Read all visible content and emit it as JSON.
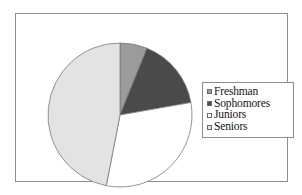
{
  "chart_data": {
    "type": "pie",
    "title": "",
    "categories": [
      "Freshman",
      "Sophomores",
      "Juniors",
      "Seniors"
    ],
    "values": [
      6,
      16,
      31,
      47
    ],
    "unit": "percent",
    "start_angle_deg": 0,
    "direction": "clockwise",
    "slice_boundaries_deg": [
      0,
      22,
      80,
      191,
      360
    ],
    "colors": [
      "#9b9b9b",
      "#4a4a4a",
      "#ffffff",
      "#e3e3e3"
    ],
    "legend": {
      "position": "right",
      "entries": [
        {
          "label": "Freshman",
          "color": "#9b9b9b",
          "value": 6
        },
        {
          "label": "Sophomores",
          "color": "#4a4a4a",
          "value": 16
        },
        {
          "label": "Juniors",
          "color": "#ffffff",
          "value": 31
        },
        {
          "label": "Seniors",
          "color": "#e3e3e3",
          "value": 47
        }
      ]
    },
    "grid": false,
    "xlabel": "",
    "ylabel": ""
  },
  "frame": {
    "border_color": "#8d8d8d",
    "background": "#ffffff"
  },
  "pie": {
    "center_x": 87,
    "center_y": 85,
    "radius": 72,
    "outline_color": "#7a7a7a"
  }
}
